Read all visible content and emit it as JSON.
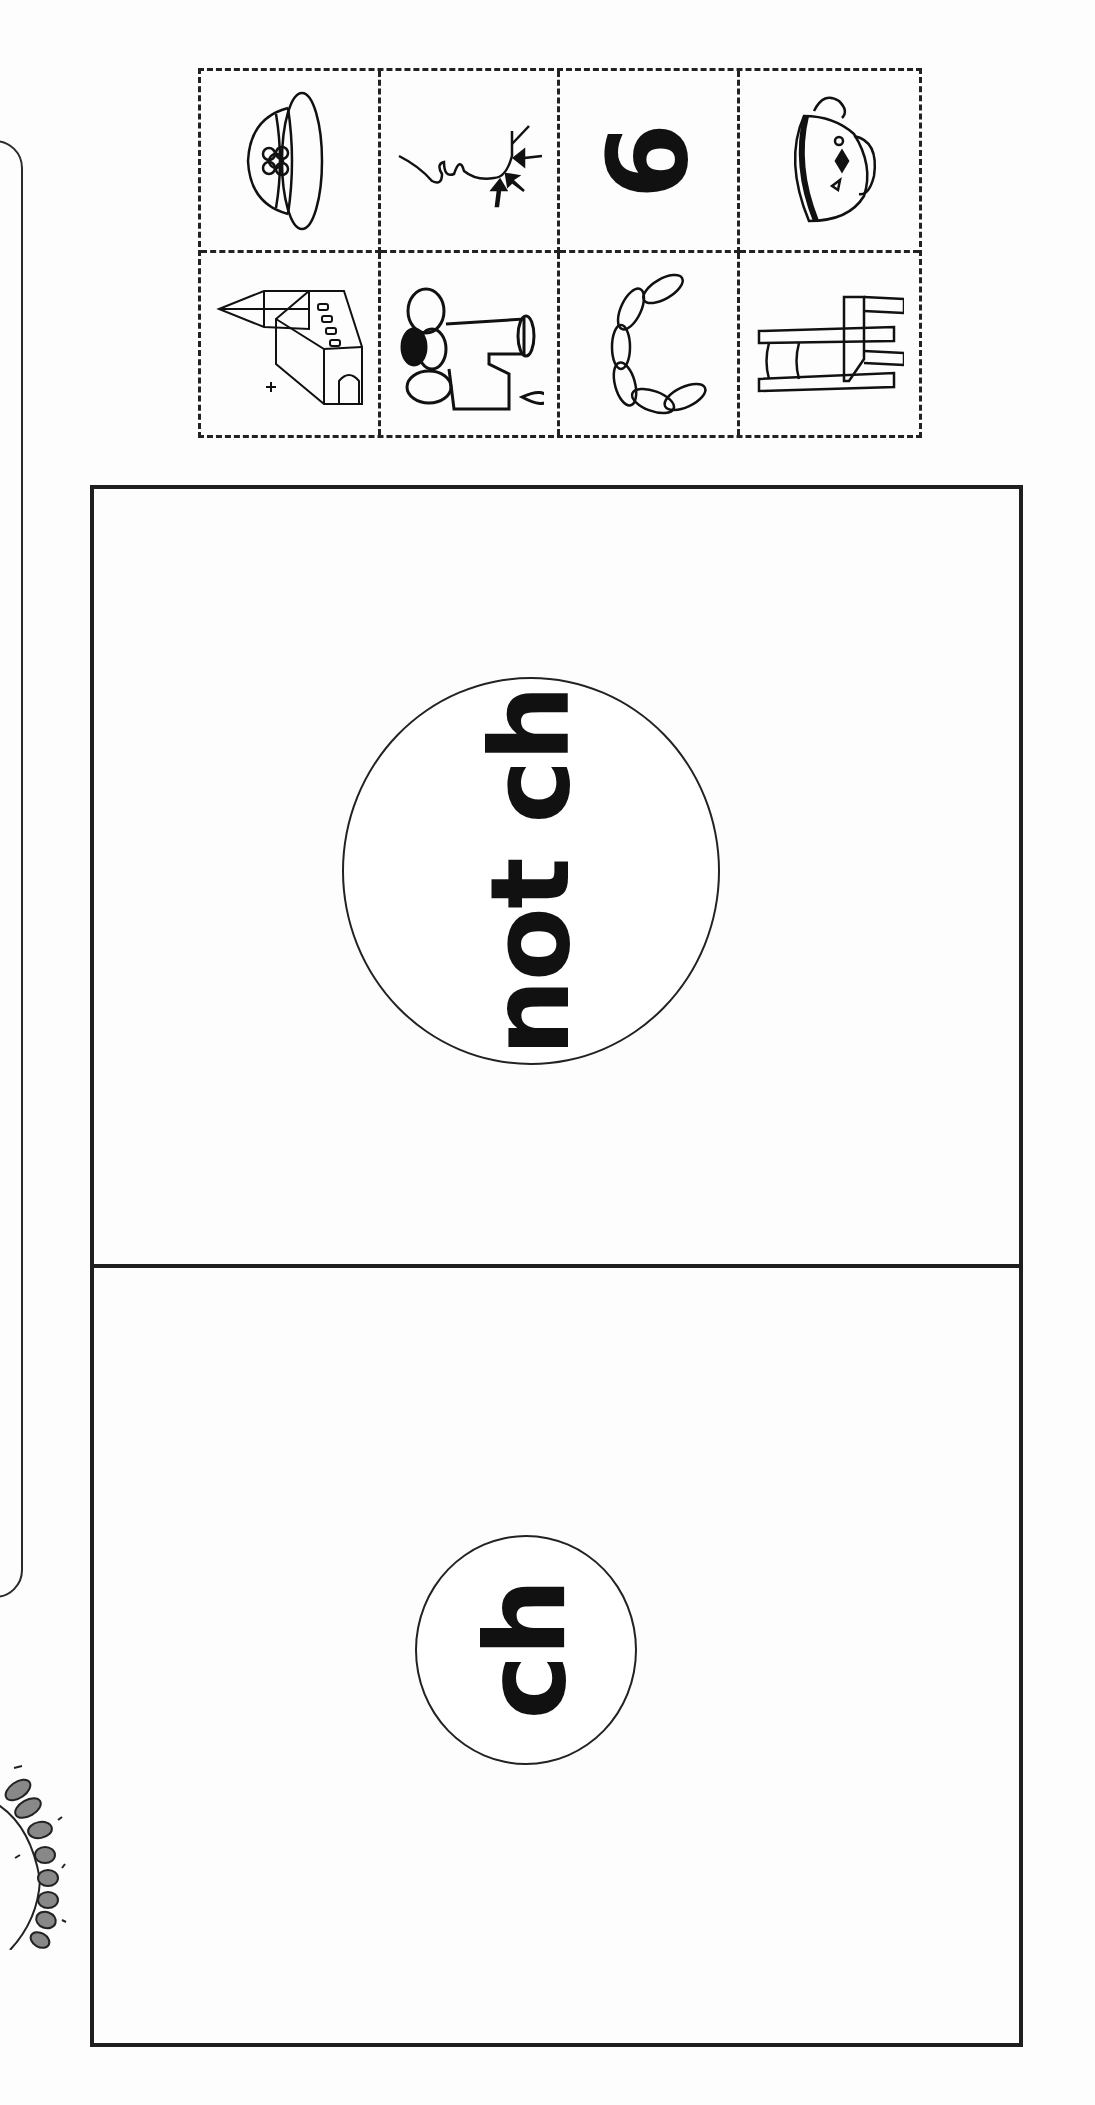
{
  "worksheet": {
    "type": "picture sort",
    "target_sound": "ch"
  },
  "picture_cards": [
    {
      "row": 1,
      "col": 1,
      "picture": "hat",
      "icon": "hat-icon"
    },
    {
      "row": 1,
      "col": 2,
      "picture": "chin",
      "icon": "chin-icon"
    },
    {
      "row": 1,
      "col": 3,
      "picture": "six",
      "icon": "six-icon",
      "glyph": "6"
    },
    {
      "row": 1,
      "col": 4,
      "picture": "cup",
      "icon": "teacup-icon"
    },
    {
      "row": 2,
      "col": 1,
      "picture": "church",
      "icon": "church-icon"
    },
    {
      "row": 2,
      "col": 2,
      "picture": "faucet",
      "icon": "faucet-icon"
    },
    {
      "row": 2,
      "col": 3,
      "picture": "chain",
      "icon": "chain-icon"
    },
    {
      "row": 2,
      "col": 4,
      "picture": "chair",
      "icon": "chair-icon"
    }
  ],
  "sort_board": {
    "zones": [
      {
        "label": "not ch"
      },
      {
        "label": "ch"
      }
    ]
  },
  "decorations": {
    "left_panel": "rounded-rectangle-outline",
    "sun": "partial-sun-doodle"
  },
  "colors": {
    "ink": "#1f1f1f",
    "paper": "#fdfdfd"
  }
}
